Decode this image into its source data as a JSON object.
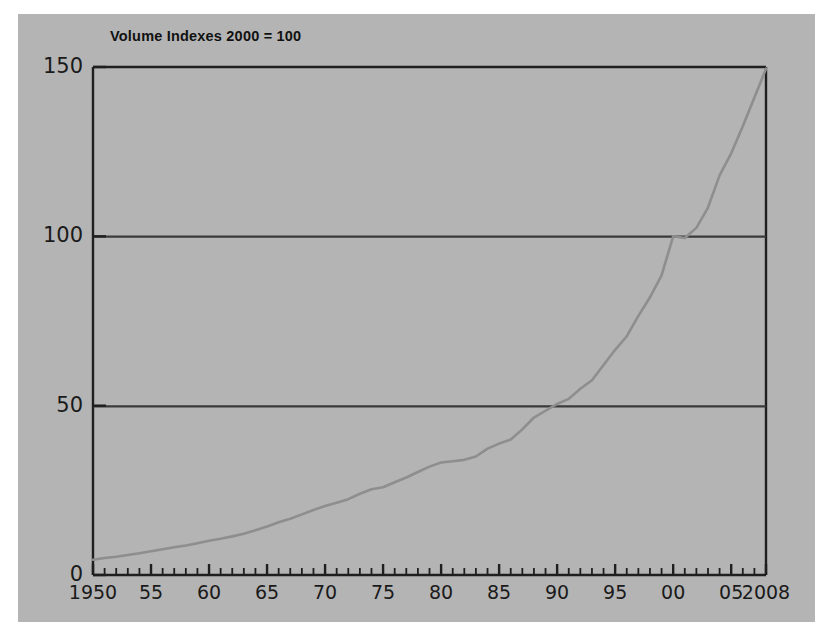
{
  "figure": {
    "background_color": "#b4b4b4",
    "page_background": "#ffffff",
    "axis_color": "#1f1f1f",
    "line_color": "#8e8e8e"
  },
  "chart_data": {
    "type": "line",
    "title": "Volume Indexes 2000 = 100",
    "xlabel": "",
    "ylabel": "",
    "xlim": [
      1950,
      2008
    ],
    "ylim": [
      0,
      150
    ],
    "grid": "horizontal gridlines at 50 and 100",
    "legend": "none",
    "y_ticks": [
      "0",
      "50",
      "100",
      "150"
    ],
    "y_tick_values": [
      0,
      50,
      100,
      150
    ],
    "x_ticks": [
      "1950",
      "55",
      "60",
      "65",
      "70",
      "75",
      "80",
      "85",
      "90",
      "95",
      "00",
      "05",
      "2008"
    ],
    "x_tick_values": [
      1950,
      1955,
      1960,
      1965,
      1970,
      1975,
      1980,
      1985,
      1990,
      1995,
      2000,
      2005,
      2008
    ],
    "x_minor_tick_interval": 1,
    "x": [
      1950,
      1951,
      1952,
      1953,
      1954,
      1955,
      1956,
      1957,
      1958,
      1959,
      1960,
      1961,
      1962,
      1963,
      1964,
      1965,
      1966,
      1967,
      1968,
      1969,
      1970,
      1971,
      1972,
      1973,
      1974,
      1975,
      1976,
      1977,
      1978,
      1979,
      1980,
      1981,
      1982,
      1983,
      1984,
      1985,
      1986,
      1987,
      1988,
      1989,
      1990,
      1991,
      1992,
      1993,
      1994,
      1995,
      1996,
      1997,
      1998,
      1999,
      2000,
      2001,
      2002,
      2003,
      2004,
      2005,
      2006,
      2007,
      2008
    ],
    "series": [
      {
        "name": "Volume Index",
        "values": [
          4.5,
          5.0,
          5.4,
          5.9,
          6.4,
          7.0,
          7.6,
          8.2,
          8.7,
          9.4,
          10.1,
          10.7,
          11.4,
          12.2,
          13.2,
          14.3,
          15.6,
          16.6,
          17.9,
          19.2,
          20.4,
          21.3,
          22.4,
          24.0,
          25.3,
          25.9,
          27.4,
          28.8,
          30.4,
          32.0,
          33.2,
          33.6,
          34.0,
          35.0,
          37.3,
          38.8,
          40.0,
          43.0,
          46.5,
          48.5,
          50.5,
          52.0,
          55.0,
          57.5,
          62.0,
          66.5,
          70.5,
          76.5,
          82.0,
          88.5,
          100.0,
          99.5,
          102.5,
          108.5,
          118.0,
          124.5,
          132.5,
          141.0,
          149.5
        ]
      }
    ]
  },
  "axis": {
    "y_labels": [
      {
        "text": "150",
        "value": 150
      },
      {
        "text": "100",
        "value": 100
      },
      {
        "text": "50",
        "value": 50
      },
      {
        "text": "0",
        "value": 0
      }
    ],
    "x_labels": [
      {
        "text": "1950",
        "value": 1950
      },
      {
        "text": "55",
        "value": 1955
      },
      {
        "text": "60",
        "value": 1960
      },
      {
        "text": "65",
        "value": 1965
      },
      {
        "text": "70",
        "value": 1970
      },
      {
        "text": "75",
        "value": 1975
      },
      {
        "text": "80",
        "value": 1980
      },
      {
        "text": "85",
        "value": 1985
      },
      {
        "text": "90",
        "value": 1990
      },
      {
        "text": "95",
        "value": 1995
      },
      {
        "text": "00",
        "value": 2000
      },
      {
        "text": "05",
        "value": 2005
      },
      {
        "text": "2008",
        "value": 2008
      }
    ]
  }
}
